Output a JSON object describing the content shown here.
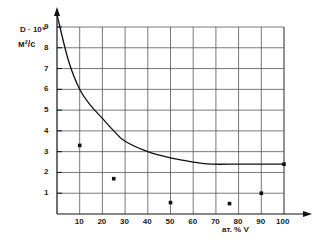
{
  "chart_data": {
    "type": "line",
    "title": "",
    "ylabel": "D · 10⁹",
    "ylabel_unit": "м²/с",
    "xlabel": "ат. % V",
    "xlim": [
      0,
      100
    ],
    "ylim": [
      0,
      9
    ],
    "grid": true,
    "legend": null,
    "x_ticks": [
      10,
      20,
      30,
      40,
      50,
      60,
      70,
      80,
      90,
      100
    ],
    "y_ticks": [
      1,
      2,
      3,
      4,
      5,
      6,
      7,
      8,
      9
    ],
    "series": [
      {
        "name": "curve",
        "kind": "line",
        "x": [
          0,
          5,
          10,
          15,
          20,
          25,
          30,
          40,
          50,
          60,
          68,
          80,
          90,
          100
        ],
        "y": [
          9.6,
          7.4,
          6.0,
          5.2,
          4.6,
          4.0,
          3.5,
          3.0,
          2.7,
          2.5,
          2.4,
          2.4,
          2.4,
          2.4
        ]
      },
      {
        "name": "points",
        "kind": "scatter",
        "x": [
          10,
          25,
          50,
          76,
          90,
          100
        ],
        "y": [
          3.3,
          1.7,
          0.55,
          0.5,
          1.0,
          2.4
        ]
      }
    ]
  }
}
